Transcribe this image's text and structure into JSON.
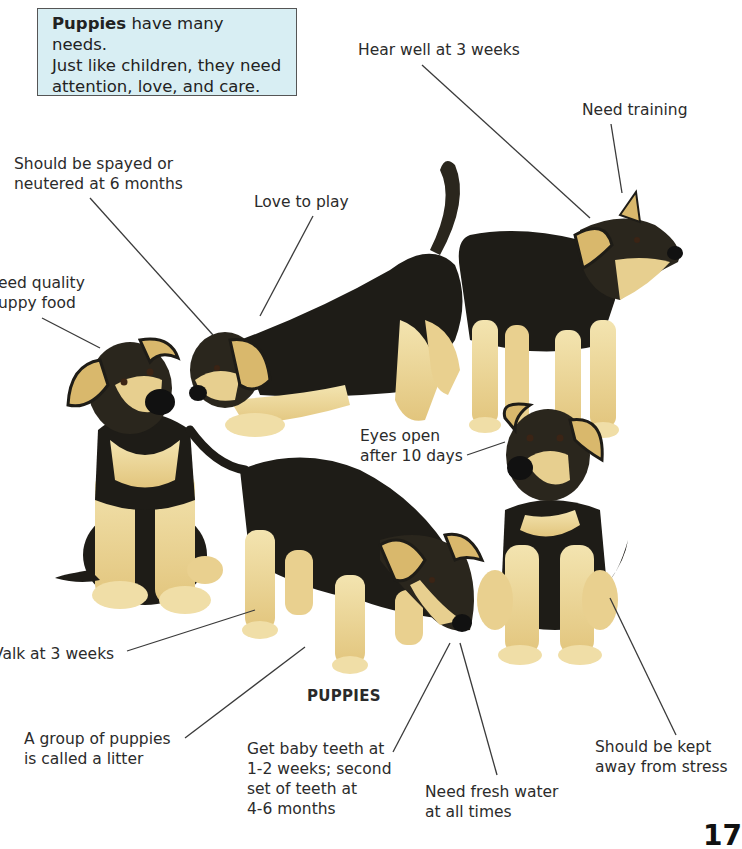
{
  "info_box": {
    "bold_lead": "Puppies",
    "text_line1_rest": " have many needs.",
    "text_line2": "Just like children, they need",
    "text_line3": "attention, love, and care."
  },
  "labels": {
    "hear_well": "Hear well at 3 weeks",
    "need_training": "Need training",
    "spayed": "Should be spayed or\nneutered at 6 months",
    "love_play": "Love to play",
    "quality_food": "eed quality\nuppy food",
    "eyes_open": "Eyes open\nafter 10 days",
    "walk": "Valk at 3 weeks",
    "litter": "A group of puppies\nis called a litter",
    "baby_teeth": "Get baby teeth at\n1-2 weeks; second\nset of teeth at\n4-6 months",
    "fresh_water": "Need fresh water\nat all times",
    "stress": "Should be kept\naway from stress"
  },
  "caption": "PUPPIES",
  "page_number": "17",
  "colors": {
    "box_bg": "#d8eef3",
    "fur_black": "#1e1c17",
    "fur_tan": "#ead79a",
    "leader_line": "#3a3a3a"
  }
}
